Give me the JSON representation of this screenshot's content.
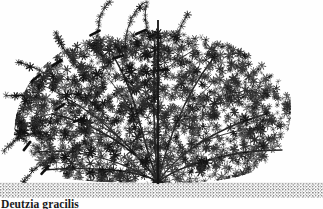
{
  "figure": {
    "caption": "Deutzia gracilis",
    "background_color": "#fefefe",
    "ink_color": "#1f1f1f",
    "soil_color": "#9a9a9a",
    "width": 323,
    "height": 209
  },
  "subject": {
    "habit_label": "broad mounded multi-stemmed shrub",
    "canopy": {
      "left": 14,
      "right": 292,
      "top": 16,
      "bottom": 180,
      "shape": "wide dome, flat-topped, widest near mid-height"
    },
    "crown_base": {
      "x": 158,
      "y": 182,
      "label": "single crown at soil line"
    },
    "stem_count": 9,
    "stem_label": "stems radiating in a vase pattern from the crown"
  },
  "reference_line": {
    "label": "vertical reference stake",
    "x": 158,
    "top_y": 20,
    "bottom_y": 183,
    "width": 1.8,
    "color": "#141414"
  },
  "ground": {
    "label": "soil line with stippled texture",
    "top_y": 183,
    "bottom_y": 198,
    "left": 0,
    "right": 323,
    "fill": "#a8a8a8"
  },
  "pruning_marks": {
    "label": "heavy diagonal cut marks on selected shoots",
    "count": 10,
    "color": "#101010",
    "positions": [
      {
        "x": 95,
        "y": 33,
        "angle": -28
      },
      {
        "x": 141,
        "y": 32,
        "angle": -22
      },
      {
        "x": 36,
        "y": 78,
        "angle": -38
      },
      {
        "x": 57,
        "y": 63,
        "angle": -30
      },
      {
        "x": 27,
        "y": 146,
        "angle": -52
      },
      {
        "x": 45,
        "y": 170,
        "angle": -48
      },
      {
        "x": 79,
        "y": 120,
        "angle": -20
      },
      {
        "x": 118,
        "y": 57,
        "angle": -18
      },
      {
        "x": 162,
        "y": 70,
        "angle": -8
      },
      {
        "x": 60,
        "y": 107,
        "angle": -34
      }
    ]
  },
  "long_shoots": {
    "label": "unpruned long shoots arching from canopy",
    "count": 7
  }
}
